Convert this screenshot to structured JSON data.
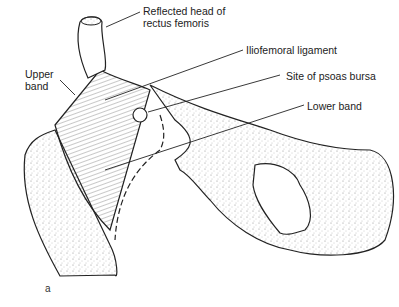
{
  "figure": {
    "panel_label": "a",
    "labels": {
      "reflected_head": [
        "Reflected head of",
        "rectus femoris"
      ],
      "iliofemoral": "Iliofemoral ligament",
      "upper_band": [
        "Upper",
        "band"
      ],
      "psoas_bursa": "Site of psoas bursa",
      "lower_band": "Lower band"
    },
    "colors": {
      "ink": "#222222",
      "stipple": "#9a9a9a",
      "background": "#ffffff"
    }
  }
}
